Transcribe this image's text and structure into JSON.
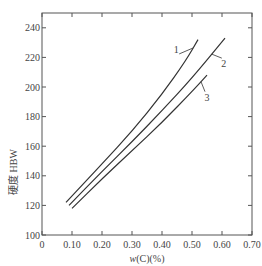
{
  "chart_data": {
    "type": "line",
    "title": "",
    "xlabel": "w(C)(%)",
    "ylabel": "硬度 HBW",
    "xlim": [
      0,
      0.7
    ],
    "ylim": [
      100,
      250
    ],
    "grid": false,
    "legend": "inline curve labels 1, 2, 3",
    "x_ticks": [
      "0",
      "0.10",
      "0.20",
      "0.30",
      "0.40",
      "0.50",
      "0.60",
      "0.70"
    ],
    "y_ticks": [
      "100",
      "120",
      "140",
      "160",
      "180",
      "200",
      "220",
      "240"
    ],
    "series": [
      {
        "name": "1",
        "x": [
          0.08,
          0.2,
          0.3,
          0.4,
          0.48,
          0.52
        ],
        "y": [
          122,
          148,
          170,
          195,
          218,
          232
        ]
      },
      {
        "name": "2",
        "x": [
          0.09,
          0.2,
          0.3,
          0.4,
          0.5,
          0.61
        ],
        "y": [
          120,
          143,
          163,
          184,
          206,
          233
        ]
      },
      {
        "name": "3",
        "x": [
          0.1,
          0.2,
          0.3,
          0.4,
          0.5,
          0.55
        ],
        "y": [
          118,
          138,
          157,
          176,
          197,
          208
        ]
      }
    ]
  }
}
